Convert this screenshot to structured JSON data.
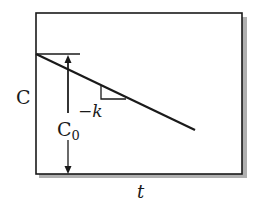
{
  "diagram": {
    "type": "zero-order concentration vs time plot",
    "y_axis_label": "C",
    "x_axis_label": "t",
    "intercept_label": "C",
    "intercept_subscript": "0",
    "slope_label": "−k",
    "colors": {
      "line": "#1a1a1a",
      "frame": "#1a1a1a",
      "shadow": "#b0b0b0",
      "background": "#ffffff"
    }
  }
}
